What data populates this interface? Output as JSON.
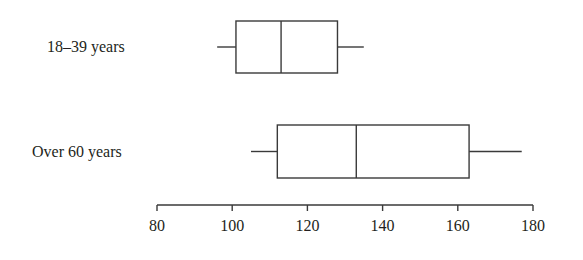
{
  "chart_data": {
    "type": "boxplot",
    "title": "",
    "xlabel": "",
    "ylabel": "",
    "orientation": "horizontal",
    "xlim": [
      80,
      180
    ],
    "ticks": [
      80,
      100,
      120,
      140,
      160,
      180
    ],
    "tick_labels": [
      "80",
      "100",
      "120",
      "140",
      "160",
      "180"
    ],
    "grid": false,
    "legend": null,
    "categories": [
      "18–39 years",
      "Over 60 years"
    ],
    "series": [
      {
        "name": "18–39 years",
        "min": 96,
        "q1": 101,
        "median": 113,
        "q3": 128,
        "max": 135
      },
      {
        "name": "Over 60 years",
        "min": 105,
        "q1": 112,
        "median": 133,
        "q3": 163,
        "max": 177
      }
    ]
  },
  "labels": {
    "group1": "18–39 years",
    "group2": "Over 60 years",
    "ticks": [
      "80",
      "100",
      "120",
      "140",
      "160",
      "180"
    ]
  }
}
